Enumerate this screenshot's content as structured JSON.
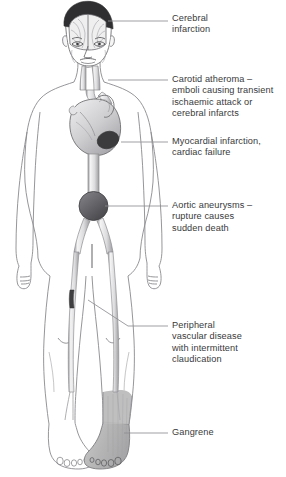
{
  "colors": {
    "background": "#ffffff",
    "outline": "#8a8a8e",
    "outline_dark": "#5b5b5f",
    "text": "#39393b",
    "leader_line": "#8e8e92",
    "vessel_fill": "#e9e9ea",
    "vessel_edge": "#8d8d91",
    "infarct_dark": "#3b3b3d",
    "aneurysm_fill": "#5e5e62",
    "gangrene_fill": "#b9b9b9",
    "brain_fill": "#efeff0",
    "skull_dark": "#2f2f31",
    "heart_fill": "#d6d6d8",
    "skin_shade": "#f2f2f3"
  },
  "labels": [
    {
      "id": "cerebral-infarction",
      "text": "Cerebral\ninfarction",
      "x": 172,
      "y": 13,
      "leader": {
        "x1": 108,
        "y1": 21,
        "x2": 168,
        "y2": 21
      }
    },
    {
      "id": "carotid-atheroma",
      "text": "Carotid atheroma –\nemboli causing transient\nischaemic attack or\ncerebral infarcts",
      "x": 172,
      "y": 74,
      "leader": {
        "x1": 108,
        "y1": 80,
        "x2": 168,
        "y2": 80
      }
    },
    {
      "id": "myocardial-infarction",
      "text": "Myocardial infarction,\ncardiac failure",
      "x": 172,
      "y": 136,
      "leader": {
        "x1": 121,
        "y1": 142,
        "x2": 168,
        "y2": 142
      }
    },
    {
      "id": "aortic-aneurysms",
      "text": "Aortic aneurysms –\nrupture causes\nsudden death",
      "x": 172,
      "y": 200,
      "leader": {
        "x1": 105,
        "y1": 206,
        "x2": 168,
        "y2": 206
      }
    },
    {
      "id": "peripheral-vascular-disease",
      "text": "Peripheral\nvascular disease\nwith intermittent\nclaudication",
      "x": 172,
      "y": 320,
      "leader_path": "M88,300 L128,326 L168,326"
    },
    {
      "id": "gangrene",
      "text": "Gangrene",
      "x": 172,
      "y": 427,
      "leader": {
        "x1": 124,
        "y1": 433,
        "x2": 168,
        "y2": 433
      }
    }
  ],
  "markers": [
    {
      "id": "brain-cutaway",
      "label": "brain shown in coronal cutaway within skull"
    },
    {
      "id": "carotid-arteries",
      "label": "paired carotid arteries in neck"
    },
    {
      "id": "heart-infarct",
      "label": "dark infarct on left ventricle"
    },
    {
      "id": "aortic-aneurysm",
      "label": "fusiform bulge at aortic bifurcation"
    },
    {
      "id": "leg-stenosis",
      "label": "dark narrowed femoral artery segment"
    },
    {
      "id": "gangrenous-foot",
      "label": "grey shaded right foot and ankle"
    }
  ]
}
